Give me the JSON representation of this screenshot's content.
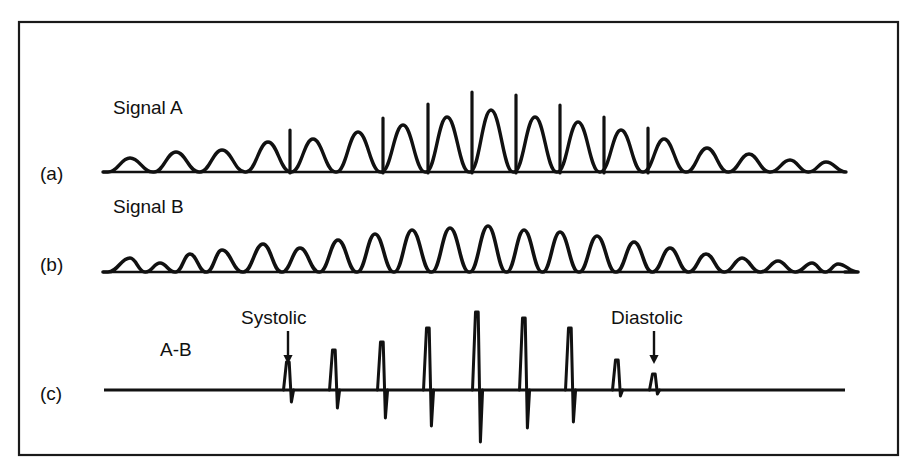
{
  "figure": {
    "frame": {
      "x": 19,
      "y": 22,
      "width": 879,
      "height": 433,
      "stroke": "#1a1a1a",
      "stroke_width": 2.2
    },
    "background": "#ffffff",
    "ink_color": "#111111"
  },
  "panels": [
    {
      "id": "a",
      "panel_label": "(a)",
      "panel_label_pos": {
        "x": 40,
        "y": 180
      },
      "signal_name": "Signal A",
      "signal_name_pos": {
        "x": 113,
        "y": 114
      },
      "baseline_y": 172,
      "baseline_x0": 103,
      "baseline_x1": 845
    },
    {
      "id": "b",
      "panel_label": "(b)",
      "panel_label_pos": {
        "x": 40,
        "y": 271
      },
      "signal_name": "Signal B",
      "signal_name_pos": {
        "x": 113,
        "y": 213
      },
      "baseline_y": 272,
      "baseline_x0": 103,
      "baseline_x1": 845
    },
    {
      "id": "c",
      "panel_label": "(c)",
      "panel_label_pos": {
        "x": 40,
        "y": 400
      },
      "signal_name": "A-B",
      "signal_name_pos": {
        "x": 160,
        "y": 356
      },
      "baseline_y": 390,
      "baseline_x0": 104,
      "baseline_x1": 845
    }
  ],
  "annotations": [
    {
      "name": "systolic-annotation",
      "label": "Systolic",
      "label_pos": {
        "x": 241,
        "y": 324
      },
      "arrow": {
        "x": 288,
        "y_top": 331,
        "y_bottom": 364
      }
    },
    {
      "name": "diastolic-annotation",
      "label": "Diastolic",
      "label_pos": {
        "x": 611,
        "y": 324
      },
      "arrow": {
        "x": 654,
        "y_top": 331,
        "y_bottom": 364
      }
    }
  ],
  "chart_data": {
    "type": "line",
    "title": "",
    "xlabel": "",
    "ylabel": "",
    "grid": false,
    "legend_position": "none",
    "x_range": [
      103,
      845
    ],
    "series": [
      {
        "name": "Signal A",
        "panel": "a",
        "baseline_y": 172,
        "description": "Pulsatile waveform with progressively growing rounded pulses, each carrying a narrow upward spike artifact from the mid-record onward.",
        "pulse_centers": [
          130,
          176,
          222,
          268,
          313,
          358,
          403,
          447,
          491,
          535,
          578,
          621,
          664,
          707,
          749,
          790,
          826
        ],
        "pulse_heights": [
          14,
          20,
          22,
          30,
          33,
          40,
          47,
          55,
          62,
          55,
          50,
          42,
          33,
          24,
          18,
          12,
          10
        ],
        "spike_indices": [
          3,
          5,
          6,
          7,
          8,
          9,
          10,
          11
        ],
        "spike_positions": [
          290,
          383,
          428,
          472,
          516,
          560,
          604,
          648
        ],
        "spike_tops": [
          130,
          118,
          104,
          92,
          95,
          105,
          117,
          128
        ]
      },
      {
        "name": "Signal B",
        "panel": "b",
        "baseline_y": 272,
        "description": "Smooth pulsatile envelope without spike artifacts; amplitude rises to a mid-record maximum then decays.",
        "pulse_centers": [
          130,
          160,
          190,
          222,
          263,
          300,
          338,
          375,
          412,
          450,
          488,
          524,
          560,
          597,
          634,
          670,
          706,
          742,
          778,
          812,
          838
        ],
        "pulse_heights": [
          14,
          9,
          18,
          22,
          28,
          24,
          32,
          38,
          42,
          44,
          46,
          42,
          40,
          36,
          30,
          24,
          18,
          14,
          11,
          9,
          8
        ]
      },
      {
        "name": "A-B",
        "panel": "c",
        "baseline_y": 390,
        "description": "Difference trace: flat baseline interrupted by biphasic spikes (upward deflection followed by a smaller downward deflection) marking each beat; spike amplitude peaks mid-record.",
        "spikes": [
          {
            "x": 288,
            "up_height": 28,
            "down_height": 12
          },
          {
            "x": 334,
            "up_height": 40,
            "down_height": 18
          },
          {
            "x": 382,
            "up_height": 48,
            "down_height": 28
          },
          {
            "x": 428,
            "up_height": 62,
            "down_height": 36
          },
          {
            "x": 477,
            "up_height": 78,
            "down_height": 52
          },
          {
            "x": 524,
            "up_height": 72,
            "down_height": 38
          },
          {
            "x": 570,
            "up_height": 62,
            "down_height": 32
          },
          {
            "x": 617,
            "up_height": 30,
            "down_height": 6
          },
          {
            "x": 654,
            "up_height": 16,
            "down_height": 4
          }
        ],
        "annotated_spikes": [
          {
            "label": "Systolic",
            "x": 288
          },
          {
            "label": "Diastolic",
            "x": 654
          }
        ]
      }
    ]
  }
}
